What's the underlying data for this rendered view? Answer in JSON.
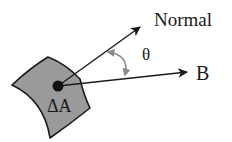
{
  "diagram": {
    "labels": {
      "normal": "Normal",
      "field": "B",
      "angle": "θ",
      "area": "ΔA"
    },
    "colors": {
      "patch_fill": "#9a9a9a",
      "patch_stroke": "#1a1a1a",
      "arrow": "#1a1a1a",
      "angle_arc": "#8a8a8a",
      "text": "#1a1a1a"
    }
  }
}
